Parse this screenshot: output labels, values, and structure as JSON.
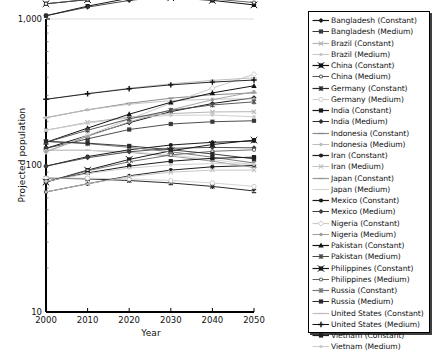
{
  "chart_data": {
    "type": "line",
    "title": "",
    "xlabel": "Year",
    "ylabel": "Projected population",
    "x": [
      2000,
      2010,
      2020,
      2030,
      2040,
      2050
    ],
    "xticks": [
      "2000",
      "2010",
      "2020",
      "2030",
      "2040",
      "2050"
    ],
    "yticks": [
      "10",
      "100",
      "1,000"
    ],
    "ytick_values": [
      10,
      100,
      1000
    ],
    "yscale": "log",
    "ylim": [
      10,
      1000
    ],
    "xlim": [
      2000,
      2050
    ],
    "grid": false,
    "legend_position": "right",
    "series": [
      {
        "name": "Bangladesh (Constant)",
        "marker": "diamond",
        "color": "#1a1a1a",
        "values": [
          131,
          160,
          196,
          233,
          265,
          290
        ]
      },
      {
        "name": "Bangladesh (Medium)",
        "marker": "square",
        "color": "#3a3a3a",
        "values": [
          131,
          152,
          176,
          192,
          199,
          202
        ]
      },
      {
        "name": "Brazil (Constant)",
        "marker": "cross",
        "color": "#b5b5b5",
        "values": [
          174,
          197,
          214,
          226,
          232,
          233
        ]
      },
      {
        "name": "Brazil (Medium)",
        "marker": "dot",
        "color": "#c9c9c9",
        "values": [
          174,
          195,
          211,
          220,
          221,
          215
        ]
      },
      {
        "name": "China (Constant)",
        "marker": "x-square",
        "color": "#111111",
        "values": [
          1270,
          1356,
          1404,
          1396,
          1340,
          1248
        ]
      },
      {
        "name": "China (Medium)",
        "marker": "circle-dot",
        "color": "#555555",
        "values": [
          1270,
          1359,
          1418,
          1420,
          1370,
          1296
        ]
      },
      {
        "name": "Germany (Constant)",
        "marker": "asterisk",
        "color": "#2b2b2b",
        "values": [
          82,
          81,
          79,
          76,
          72,
          67
        ]
      },
      {
        "name": "Germany (Medium)",
        "marker": "open-circle",
        "color": "#cfcfcf",
        "values": [
          82,
          82,
          81,
          79,
          76,
          72
        ]
      },
      {
        "name": "India (Constant)",
        "marker": "square",
        "color": "#1a1a1a",
        "values": [
          1053,
          1224,
          1387,
          1523,
          1627,
          1692
        ]
      },
      {
        "name": "India (Medium)",
        "marker": "diamond",
        "color": "#2e2e2e",
        "values": [
          1053,
          1206,
          1339,
          1431,
          1478,
          1492
        ]
      },
      {
        "name": "Indonesia (Constant)",
        "marker": "dash",
        "color": "#8c8c8c",
        "values": [
          212,
          240,
          266,
          288,
          304,
          313
        ]
      },
      {
        "name": "Indonesia (Medium)",
        "marker": "dot",
        "color": "#bdbdbd",
        "values": [
          212,
          240,
          262,
          277,
          284,
          285
        ]
      },
      {
        "name": "Iran (Constant)",
        "marker": "circle",
        "color": "#1f1f1f",
        "values": [
          66,
          75,
          85,
          93,
          98,
          100
        ]
      },
      {
        "name": "Iran (Medium)",
        "marker": "cross",
        "color": "#c2c2c2",
        "values": [
          66,
          75,
          84,
          90,
          93,
          93
        ]
      },
      {
        "name": "Japan (Constant)",
        "marker": "dash",
        "color": "#9a9a9a",
        "values": [
          127,
          127,
          123,
          116,
          107,
          97
        ]
      },
      {
        "name": "Japan (Medium)",
        "marker": "none",
        "color": "#d2d2d2",
        "values": [
          127,
          127,
          124,
          118,
          110,
          101
        ]
      },
      {
        "name": "Mexico (Constant)",
        "marker": "circle",
        "color": "#1a1a1a",
        "values": [
          99,
          115,
          128,
          138,
          144,
          147
        ]
      },
      {
        "name": "Mexico (Medium)",
        "marker": "diamond",
        "color": "#3d3d3d",
        "values": [
          99,
          113,
          124,
          131,
          133,
          132
        ]
      },
      {
        "name": "Nigeria (Constant)",
        "marker": "open-diamond",
        "color": "#cbcbcb",
        "values": [
          124,
          160,
          207,
          266,
          337,
          420
        ]
      },
      {
        "name": "Nigeria (Medium)",
        "marker": "dot",
        "color": "#9e9e9e",
        "values": [
          124,
          158,
          198,
          240,
          281,
          319
        ]
      },
      {
        "name": "Pakistan (Constant)",
        "marker": "triangle",
        "color": "#151515",
        "values": [
          144,
          180,
          224,
          270,
          313,
          350
        ]
      },
      {
        "name": "Pakistan (Medium)",
        "marker": "asterisk",
        "color": "#4a4a4a",
        "values": [
          144,
          174,
          208,
          238,
          259,
          272
        ]
      },
      {
        "name": "Philippines (Constant)",
        "marker": "x-square",
        "color": "#1a1a1a",
        "values": [
          77,
          93,
          110,
          126,
          139,
          149
        ]
      },
      {
        "name": "Philippines (Medium)",
        "marker": "circle-dot",
        "color": "#616161",
        "values": [
          77,
          92,
          106,
          118,
          125,
          128
        ]
      },
      {
        "name": "Russia (Constant)",
        "marker": "asterisk",
        "color": "#777777",
        "values": [
          146,
          141,
          133,
          124,
          114,
          104
        ]
      },
      {
        "name": "Russia (Medium)",
        "marker": "square",
        "color": "#2a2a2a",
        "values": [
          146,
          142,
          136,
          128,
          120,
          111
        ]
      },
      {
        "name": "United States (Constant)",
        "marker": "dash",
        "color": "#bfbfbf",
        "values": [
          283,
          310,
          337,
          361,
          381,
          397
        ]
      },
      {
        "name": "United States (Medium)",
        "marker": "plus",
        "color": "#111111",
        "values": [
          283,
          309,
          334,
          355,
          371,
          383
        ]
      },
      {
        "name": "Vietnam (Constant)",
        "marker": "square",
        "color": "#1c1c1c",
        "values": [
          78,
          89,
          99,
          107,
          112,
          114
        ]
      },
      {
        "name": "Vietnam (Medium)",
        "marker": "dot",
        "color": "#cccccc",
        "values": [
          78,
          88,
          96,
          101,
          103,
          102
        ]
      }
    ]
  },
  "legend": {
    "entries": [
      {
        "label": "Bangladesh (Constant)"
      },
      {
        "label": "Bangladesh (Medium)"
      },
      {
        "label": "Brazil (Constant)"
      },
      {
        "label": "Brazil (Medium)"
      },
      {
        "label": "China (Constant)"
      },
      {
        "label": "China (Medium)"
      },
      {
        "label": "Germany (Constant)"
      },
      {
        "label": "Germany (Medium)"
      },
      {
        "label": "India (Constant)"
      },
      {
        "label": "India (Medium)"
      },
      {
        "label": "Indonesia (Constant)"
      },
      {
        "label": "Indonesia (Medium)"
      },
      {
        "label": "Iran (Constant)"
      },
      {
        "label": "Iran (Medium)"
      },
      {
        "label": "Japan (Constant)"
      },
      {
        "label": "Japan (Medium)"
      },
      {
        "label": "Mexico (Constant)"
      },
      {
        "label": "Mexico (Medium)"
      },
      {
        "label": "Nigeria (Constant)"
      },
      {
        "label": "Nigeria (Medium)"
      },
      {
        "label": "Pakistan (Constant)"
      },
      {
        "label": "Pakistan (Medium)"
      },
      {
        "label": "Philippines (Constant)"
      },
      {
        "label": "Philippines (Medium)"
      },
      {
        "label": "Russia (Constant)"
      },
      {
        "label": "Russia (Medium)"
      },
      {
        "label": "United States (Constant)"
      },
      {
        "label": "United States (Medium)"
      },
      {
        "label": "Vietnam (Constant)"
      },
      {
        "label": "Vietnam (Medium)"
      }
    ]
  }
}
